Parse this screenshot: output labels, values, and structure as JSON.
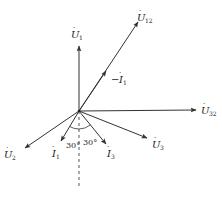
{
  "diagram": {
    "type": "phasor-diagram",
    "origin": {
      "x": 79,
      "y": 111
    },
    "stroke_color": "#333333",
    "phasors": [
      {
        "id": "U1",
        "symbol": "U",
        "dot": true,
        "subscript": "1",
        "tip": {
          "x": 79,
          "y": 46
        },
        "label_pos": {
          "x": 71,
          "y": 38
        }
      },
      {
        "id": "U12",
        "symbol": "U",
        "dot": true,
        "subscript": "12",
        "tip": {
          "x": 138,
          "y": 22
        },
        "label_pos": {
          "x": 137,
          "y": 21
        }
      },
      {
        "id": "U32",
        "symbol": "U",
        "dot": true,
        "subscript": "32",
        "tip": {
          "x": 196,
          "y": 110
        },
        "label_pos": {
          "x": 201,
          "y": 114
        }
      },
      {
        "id": "U2",
        "symbol": "U",
        "dot": true,
        "subscript": "2",
        "tip": {
          "x": 25,
          "y": 148
        },
        "label_pos": {
          "x": 4,
          "y": 158
        }
      },
      {
        "id": "U3",
        "symbol": "U",
        "dot": true,
        "subscript": "3",
        "tip": {
          "x": 147,
          "y": 138
        },
        "label_pos": {
          "x": 152,
          "y": 148
        }
      },
      {
        "id": "I1",
        "symbol": "I",
        "dot": true,
        "subscript": "1",
        "tip": {
          "x": 61,
          "y": 141
        },
        "label_pos": {
          "x": 52,
          "y": 157
        }
      },
      {
        "id": "I3",
        "symbol": "I",
        "dot": true,
        "subscript": "3",
        "tip": {
          "x": 106,
          "y": 144
        },
        "label_pos": {
          "x": 107,
          "y": 157
        }
      }
    ],
    "minus_I1": {
      "text_prefix": "−",
      "symbol": "I",
      "subscript": "1",
      "arrow_at": {
        "x": 105,
        "y": 72
      },
      "label_pos": {
        "x": 111,
        "y": 83
      }
    },
    "reference_line": {
      "style": "dashed",
      "from": {
        "x": 79,
        "y": 111
      },
      "to": {
        "x": 79,
        "y": 188
      }
    },
    "angles": [
      {
        "text": "30°",
        "pos": {
          "x": 66,
          "y": 148
        }
      },
      {
        "text": "30°",
        "pos": {
          "x": 83,
          "y": 145
        }
      }
    ]
  }
}
